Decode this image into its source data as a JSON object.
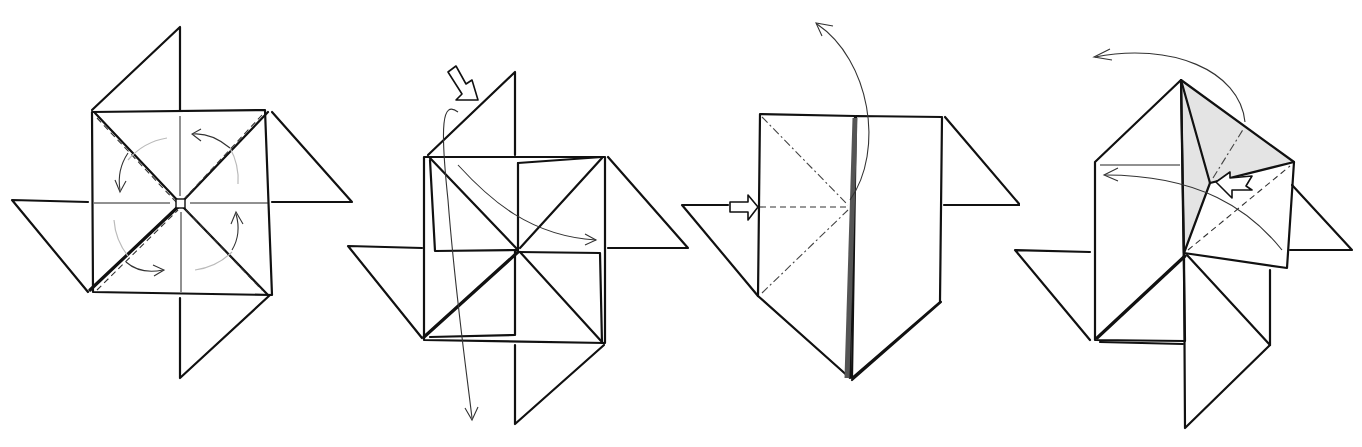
{
  "figure": {
    "steps": [
      {
        "id": 1,
        "description": "Pinwheel base with four flaps; rotation arrows around center"
      },
      {
        "id": 2,
        "description": "Push-in arrow at top-left flap; fold flap down and across"
      },
      {
        "id": 3,
        "description": "Collapsed form with push arrow at left; valley fold up"
      },
      {
        "id": 4,
        "description": "Squash fold with shaded layer and push arrow; fold back"
      }
    ],
    "colors": {
      "line": "#111111",
      "shade": "#e4e4e4",
      "guide": "#bbbbbb"
    }
  }
}
